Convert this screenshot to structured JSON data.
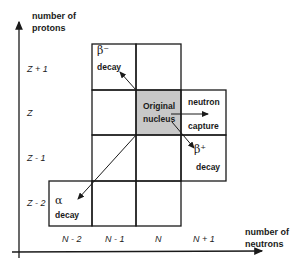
{
  "diagram": {
    "y_axis": {
      "title_line1": "number of",
      "title_line2": "protons",
      "ticks": [
        "Z + 1",
        "Z",
        "Z - 1",
        "Z - 2"
      ]
    },
    "x_axis": {
      "title_line1": "number of",
      "title_line2": "neutrons",
      "ticks": [
        "N - 2",
        "N - 1",
        "N",
        "N + 1"
      ]
    },
    "cells": {
      "original": {
        "line1": "Original",
        "line2": "nucleus",
        "fill": "#c8c8c8"
      },
      "beta_minus": {
        "symbol": "β⁻",
        "label": "decay"
      },
      "beta_plus": {
        "symbol": "β⁺",
        "label": "decay"
      },
      "neutron_capture": {
        "line1": "neutron",
        "line2": "capture"
      },
      "alpha": {
        "symbol": "α",
        "label": "decay"
      }
    },
    "colors": {
      "line": "#1a1a1a",
      "shaded": "#c8c8c8",
      "background": "#ffffff"
    }
  }
}
